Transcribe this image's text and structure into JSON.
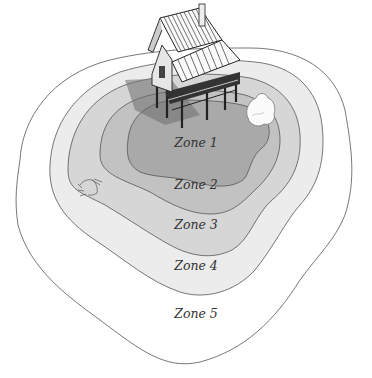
{
  "diagram": {
    "type": "concentric-zone-map",
    "zones": [
      {
        "label": "Zone 1",
        "fill": "#a9a9a9"
      },
      {
        "label": "Zone 2",
        "fill": "#c2c2c2"
      },
      {
        "label": "Zone 3",
        "fill": "#d6d6d6"
      },
      {
        "label": "Zone 4",
        "fill": "#ececec"
      },
      {
        "label": "Zone 5",
        "fill": "#ffffff"
      }
    ],
    "features": [
      {
        "name": "stilt-house",
        "zone": "Zone 1"
      },
      {
        "name": "shrub",
        "zone": "Zone 1"
      },
      {
        "name": "grass-tuft",
        "zone": "Zone 3"
      }
    ]
  }
}
